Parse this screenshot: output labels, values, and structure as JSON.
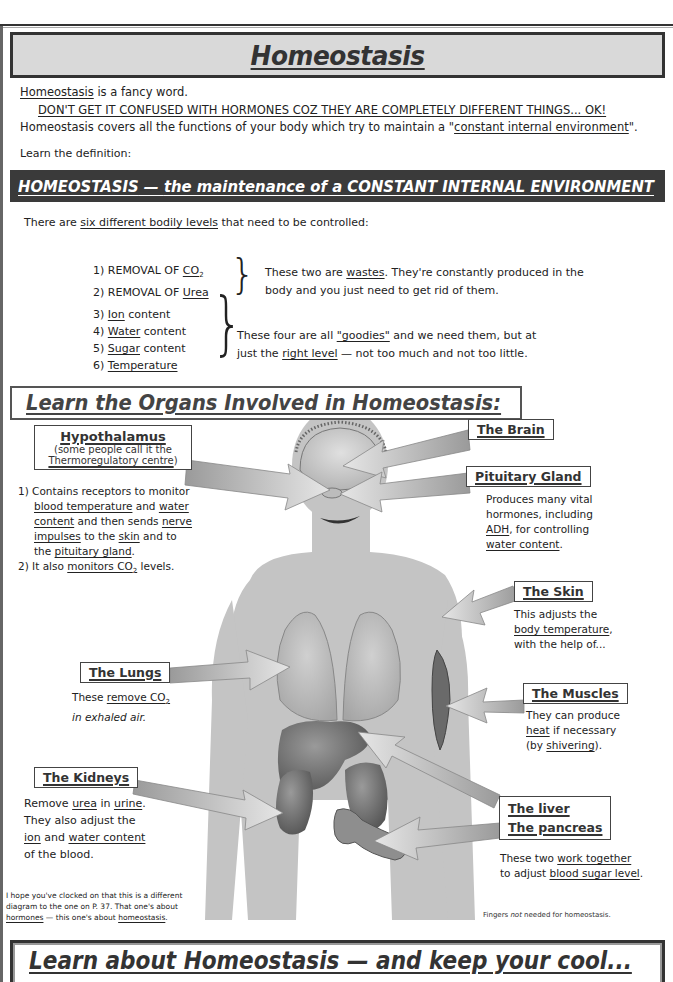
{
  "page": {
    "number": "35"
  },
  "title": "Homeostasis",
  "intro": {
    "line1_term": "Homeostasis",
    "line1_rest": " is a fancy word.",
    "warning": "DON'T GET IT CONFUSED WITH HORMONES COZ THEY ARE COMPLETELY DIFFERENT THINGS... OK!",
    "line3_start": "Homeostasis covers all the functions of your body which try to maintain a \"",
    "line3_term": "constant internal environment",
    "line3_end": "\".",
    "learn_def": "Learn the definition:"
  },
  "definition": {
    "term": "HOMEOSTASIS",
    "dash": " — ",
    "text": "the maintenance of a CONSTANT INTERNAL ENVIRONMENT"
  },
  "levels": {
    "intro_start": "There are ",
    "intro_term": "six different bodily levels",
    "intro_end": " that need to be controlled:",
    "wastes": [
      {
        "prefix": "1) REMOVAL OF ",
        "term": "CO",
        "sub": "2"
      },
      {
        "prefix": "2) REMOVAL OF ",
        "term": "Urea",
        "sub": ""
      }
    ],
    "goodies": [
      {
        "num": "3) ",
        "term": "Ion",
        "rest": " content"
      },
      {
        "num": "4) ",
        "term": "Water",
        "rest": " content"
      },
      {
        "num": "5) ",
        "term": "Sugar",
        "rest": " content"
      },
      {
        "num": "6) ",
        "term": "Temperature",
        "rest": ""
      }
    ],
    "wastes_note": {
      "a": "These two are ",
      "term": "wastes",
      "b": ".  They're constantly produced in the",
      "c": "body and you just need to get rid of them."
    },
    "goodies_note": {
      "a": "These four are all ",
      "term1": "\"goodies\"",
      "b": " and we need them, but at",
      "c": "just the ",
      "term2": "right level",
      "d": " — not too much and not too little."
    }
  },
  "organs_title": "Learn the Organs Involved in Homeostasis:",
  "organs": {
    "hypothalamus": {
      "label": "Hypothalamus",
      "sub1": "(some people call it the",
      "sub2": "Thermoregulatory centre",
      "sub2_end": ")",
      "desc": {
        "p1_a": "1) Contains receptors to monitor",
        "p1_t1": "blood temperature",
        "p1_b": " and ",
        "p1_t2": "water",
        "p1_t3": "content",
        "p1_c": " and then sends ",
        "p1_t4": "nerve",
        "p1_t5": "impulses",
        "p1_d": " to the ",
        "p1_t6": "skin",
        "p1_e": " and to",
        "p1_f": "the ",
        "p1_t7": "pituitary gland",
        "p1_g": ".",
        "p2_a": "2) It also ",
        "p2_t": "monitors CO",
        "p2_sub": "2",
        "p2_b": " levels."
      }
    },
    "brain": {
      "label": "The Brain"
    },
    "pituitary": {
      "label": "Pituitary Gland",
      "l1": "Produces many vital",
      "l2": "hormones, including",
      "t1": "ADH",
      "l3": ", for controlling",
      "t2": "water content",
      "l4": "."
    },
    "skin": {
      "label": "The Skin",
      "l1": "This adjusts the",
      "t1": "body temperature",
      "l2": ",",
      "l3": "with the help of..."
    },
    "lungs": {
      "label": "The Lungs",
      "l1": "These ",
      "t1": "remove CO",
      "sub": "2",
      "l2": "in exhaled air."
    },
    "muscles": {
      "label": "The Muscles",
      "l1": "They can produce",
      "t1": "heat",
      "l2": " if necessary",
      "l3": "(by ",
      "t2": "shivering",
      "l4": ")."
    },
    "kidneys": {
      "label": "The Kidneys",
      "l1": "Remove ",
      "t1": "urea",
      "l2": " in ",
      "t2": "urine",
      "l3": ".",
      "l4": "They also adjust the",
      "t3": "ion",
      "l5": " and ",
      "t4": "water content",
      "l6": "of the blood."
    },
    "liver_pancreas": {
      "label1": "The liver",
      "label2": "The pancreas",
      "l1": "These two ",
      "t1": "work together",
      "l2": "to adjust ",
      "t2": "blood sugar level",
      "l3": "."
    }
  },
  "footer_note": {
    "a": "I hope you've clocked on that this is a different diagram to the one on P. 37.  That one's about ",
    "t1": "hormones",
    "b": " — this one's about ",
    "t2": "homeostasis",
    "c": "."
  },
  "fingers_note": {
    "a": "Fingers ",
    "em": "not",
    "b": " needed for homeostasis."
  },
  "bottom_title": "Learn about Homeostasis — and keep your cool..."
}
